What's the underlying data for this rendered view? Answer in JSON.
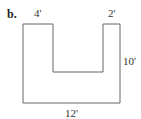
{
  "figure": {
    "part_label": "b.",
    "shape": "U-shape",
    "colors": {
      "stroke": "#666666",
      "text": "#333333",
      "background": "#ffffff"
    },
    "dimensions": {
      "top_left_width": "4'",
      "top_right_width": "2'",
      "right_height": "10'",
      "bottom_width": "12'"
    },
    "outline_points": "23,24 53,24 53,72 103,72 103,24 120,24 120,103 23,103"
  }
}
